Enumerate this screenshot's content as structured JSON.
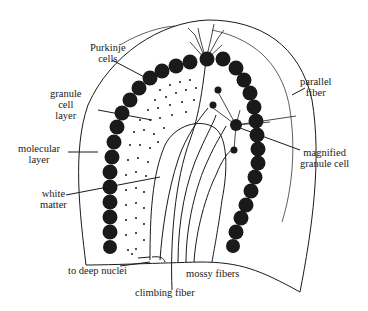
{
  "figure": {
    "colors": {
      "ink": "#1a1a1a",
      "background": "#ffffff"
    }
  },
  "labels": {
    "purkinje_cells": [
      "Purkinje",
      "cells"
    ],
    "granule_cell_layer": [
      "granule",
      "cell",
      "layer"
    ],
    "molecular_layer": [
      "molecular",
      "layer"
    ],
    "white_matter": [
      "white",
      "matter"
    ],
    "parallel_fiber": [
      "parallel",
      "fiber"
    ],
    "magnified_granule_cell": [
      "magnified",
      "granule cell"
    ],
    "to_deep_nuclei": "to deep nuclei",
    "climbing_fiber": "climbing fiber",
    "mossy_fibers": "mossy fibers"
  }
}
